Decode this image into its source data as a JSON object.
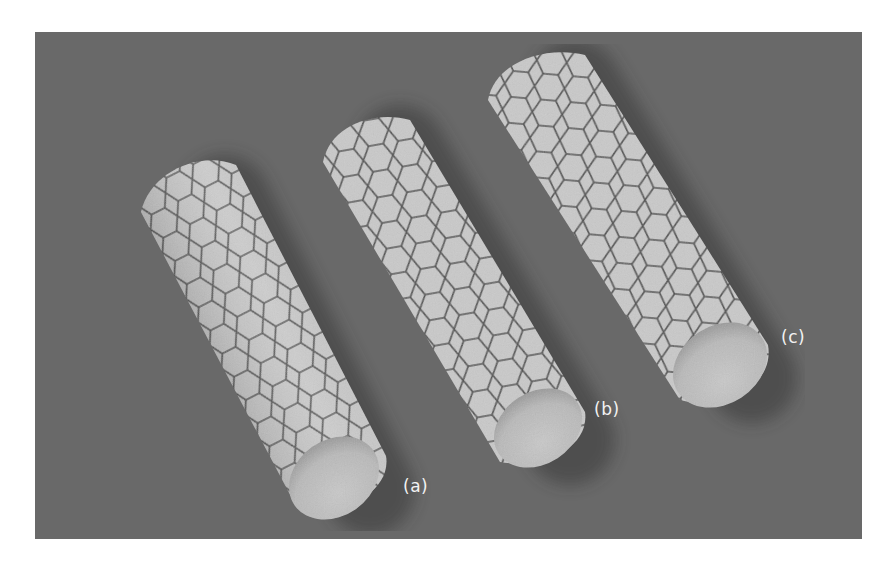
{
  "figure": {
    "background_color": "#696969",
    "tube_surface_color": "#c9c9c9",
    "hex_edge_color": "#4d4d4d",
    "end_face_color": "#bdbdbd",
    "tubes": [
      {
        "id": "a",
        "label": "(a)",
        "label_x": 403,
        "label_y": 476,
        "axis": [
          195,
          190,
          335,
          475
        ],
        "radius": 52
      },
      {
        "id": "b",
        "label": "(b)",
        "label_x": 594,
        "label_y": 399,
        "axis": [
          370,
          140,
          535,
          428
        ],
        "radius": 50
      },
      {
        "id": "c",
        "label": "(c)",
        "label_x": 781,
        "label_y": 327,
        "axis": [
          545,
          75,
          718,
          365
        ],
        "radius": 54
      }
    ]
  }
}
